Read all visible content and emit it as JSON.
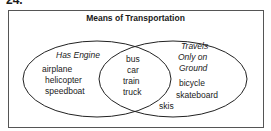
{
  "problem_number": "24.",
  "title": "Means of Transportation",
  "sets": {
    "left": {
      "label": "Has Engine",
      "only": [
        "airplane",
        "helicopter",
        "speedboat"
      ]
    },
    "right": {
      "label_lines": [
        "Travels",
        "Only on",
        "Ground"
      ],
      "only": [
        "bicycle",
        "skateboard"
      ]
    },
    "both": [
      "bus",
      "car",
      "train",
      "truck"
    ],
    "outside_right_edge": "skis"
  }
}
